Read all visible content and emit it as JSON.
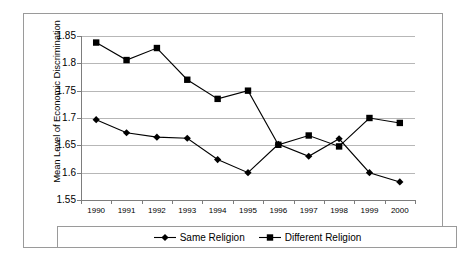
{
  "chart_data": {
    "type": "line",
    "title": "",
    "xlabel": "",
    "ylabel": "Mean Level of Economic Discrimination",
    "categories": [
      "1990",
      "1991",
      "1992",
      "1993",
      "1994",
      "1995",
      "1996",
      "1997",
      "1998",
      "1999",
      "2000"
    ],
    "ylim": [
      1.55,
      1.85
    ],
    "yticks": [
      "1.55",
      "1.6",
      "1.65",
      "1.7",
      "1.75",
      "1.8",
      "1.85"
    ],
    "ytick_values": [
      1.55,
      1.6,
      1.65,
      1.7,
      1.75,
      1.8,
      1.85
    ],
    "grid": true,
    "legend_position": "bottom",
    "series": [
      {
        "name": "Same Religion",
        "marker": "diamond",
        "color": "#000000",
        "values": [
          1.697,
          1.673,
          1.665,
          1.663,
          1.624,
          1.6,
          1.652,
          1.63,
          1.662,
          1.6,
          1.583
        ]
      },
      {
        "name": "Different Religion",
        "marker": "square",
        "color": "#000000",
        "values": [
          1.838,
          1.806,
          1.828,
          1.77,
          1.735,
          1.75,
          1.651,
          1.668,
          1.648,
          1.7,
          1.691
        ]
      }
    ]
  },
  "axis": {
    "y_title": "Mean Level of Economic Discrimination"
  },
  "legend": {
    "entries": [
      {
        "label": "Same Religion",
        "marker": "diamond"
      },
      {
        "label": "Different Religion",
        "marker": "square"
      }
    ]
  },
  "colors": {
    "series": "#000000",
    "gridline": "#b7b7b7",
    "axis": "#7d7d7d",
    "frame": "#9a9a9a",
    "background": "#ffffff"
  }
}
